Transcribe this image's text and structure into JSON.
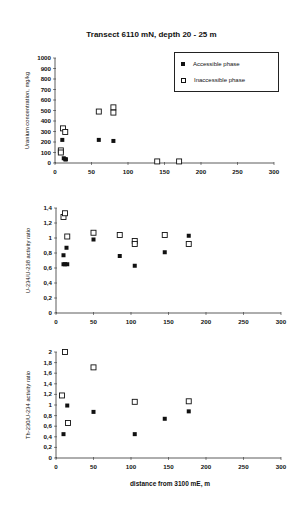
{
  "title": "Transect 6110 mN, depth 20 - 25 m",
  "xlabel": "distance from 3100 mE, m",
  "legend": {
    "accessible": "Accessible phase",
    "inaccessible": "Inaccessible phase"
  },
  "chart_data": [
    {
      "type": "scatter",
      "title": "Transect 6110 mN, depth 20 - 25 m",
      "xlabel": "",
      "ylabel": "Uranium concentration, mg/kg",
      "xlim": [
        0,
        300
      ],
      "ylim": [
        0,
        1000
      ],
      "xticks": [
        0,
        50,
        100,
        150,
        200,
        250,
        300
      ],
      "yticks": [
        0,
        100,
        200,
        300,
        400,
        500,
        600,
        700,
        800,
        900,
        1000
      ],
      "legend_position": "upper right (boxed)",
      "series": [
        {
          "name": "Accessible phase",
          "marker": "filled-square",
          "x": [
            10,
            12,
            14,
            15,
            60,
            80
          ],
          "y": [
            220,
            45,
            35,
            35,
            220,
            210
          ]
        },
        {
          "name": "Inaccessible phase",
          "marker": "open-square",
          "x": [
            8,
            8,
            11,
            14,
            60,
            80,
            80,
            140,
            170
          ],
          "y": [
            120,
            100,
            330,
            295,
            490,
            530,
            480,
            15,
            15
          ]
        }
      ]
    },
    {
      "type": "scatter",
      "ylabel": "U-234/U-238 activity ratio",
      "xlim": [
        0,
        300
      ],
      "ylim": [
        0,
        1.4
      ],
      "xticks": [
        0,
        50,
        100,
        150,
        200,
        250,
        300
      ],
      "yticks": [
        0,
        0.2,
        0.4,
        0.6,
        0.8,
        1,
        1.2,
        1.4
      ],
      "series": [
        {
          "name": "Accessible phase",
          "marker": "filled-square",
          "x": [
            10,
            10,
            12,
            14,
            15,
            50,
            85,
            105,
            145,
            177
          ],
          "y": [
            0.65,
            0.77,
            0.65,
            0.87,
            0.65,
            0.98,
            0.76,
            0.63,
            0.81,
            1.03
          ]
        },
        {
          "name": "Inaccessible phase",
          "marker": "open-square",
          "x": [
            10,
            12,
            15,
            50,
            85,
            105,
            105,
            145,
            177
          ],
          "y": [
            1.28,
            1.33,
            1.02,
            1.07,
            1.04,
            0.96,
            0.92,
            1.04,
            0.92
          ]
        }
      ]
    },
    {
      "type": "scatter",
      "ylabel": "Th-230/U-234 activity ratio",
      "xlabel": "distance from 3100 mE, m",
      "xlim": [
        0,
        300
      ],
      "ylim": [
        0,
        2
      ],
      "xticks": [
        0,
        50,
        100,
        150,
        200,
        250,
        300
      ],
      "yticks": [
        0,
        0.2,
        0.4,
        0.6,
        0.8,
        1,
        1.2,
        1.4,
        1.6,
        1.8,
        2
      ],
      "series": [
        {
          "name": "Accessible phase",
          "marker": "filled-square",
          "x": [
            10,
            15,
            50,
            105,
            145,
            177
          ],
          "y": [
            0.45,
            0.99,
            0.87,
            0.45,
            0.74,
            0.88
          ]
        },
        {
          "name": "Inaccessible phase",
          "marker": "open-square",
          "x": [
            8,
            12,
            16,
            50,
            105,
            177
          ],
          "y": [
            1.18,
            2.0,
            0.66,
            1.71,
            1.06,
            1.07
          ]
        }
      ]
    }
  ],
  "panels": [
    {
      "ylabel": "Uranium concentration, mg/kg",
      "xtick_labels": [
        "0",
        "50",
        "100",
        "150",
        "200",
        "250",
        "300"
      ],
      "ytick_labels": [
        "0",
        "100",
        "200",
        "300",
        "400",
        "500",
        "600",
        "700",
        "800",
        "900",
        "1000"
      ]
    },
    {
      "ylabel": "U-234/U-238 activity ratio",
      "xtick_labels": [
        "0",
        "50",
        "100",
        "150",
        "200",
        "250",
        "300"
      ],
      "ytick_labels": [
        "0",
        "0,2",
        "0,4",
        "0,6",
        "0,8",
        "1",
        "1,2",
        "1,4"
      ]
    },
    {
      "ylabel": "Th-230/U-234 activity ratio",
      "xtick_labels": [
        "0",
        "50",
        "100",
        "150",
        "200",
        "250",
        "300"
      ],
      "ytick_labels": [
        "0",
        "0,2",
        "0,4",
        "0,6",
        "0,8",
        "1",
        "1,2",
        "1,4",
        "1,6",
        "1,8",
        "2"
      ]
    }
  ]
}
